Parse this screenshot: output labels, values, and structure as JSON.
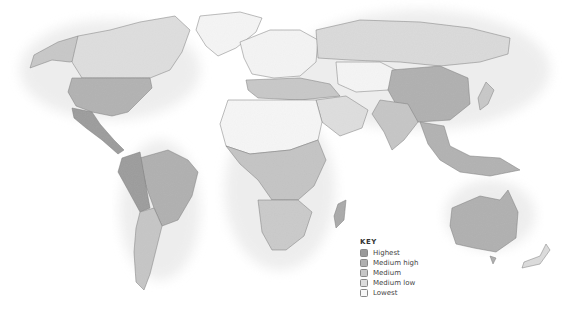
{
  "map": {
    "type": "choropleth world map",
    "style": "grayscale relief"
  },
  "legend": {
    "title": "KEY",
    "items": [
      {
        "label": "Highest",
        "color": "#9a9a9a"
      },
      {
        "label": "Medium high",
        "color": "#b0b0b0"
      },
      {
        "label": "Medium",
        "color": "#c6c6c6"
      },
      {
        "label": "Medium low",
        "color": "#dcdcdc"
      },
      {
        "label": "Lowest",
        "color": "#f7f7f7"
      }
    ]
  },
  "regions": [
    {
      "name": "Canada",
      "level": "Medium low"
    },
    {
      "name": "Alaska",
      "level": "Medium"
    },
    {
      "name": "United States",
      "level": "Medium high"
    },
    {
      "name": "Mexico & Central America",
      "level": "Highest"
    },
    {
      "name": "Greenland",
      "level": "Lowest"
    },
    {
      "name": "Brazil",
      "level": "Medium high"
    },
    {
      "name": "Andean South America",
      "level": "Highest"
    },
    {
      "name": "Southern Cone",
      "level": "Medium"
    },
    {
      "name": "Europe",
      "level": "Lowest"
    },
    {
      "name": "Mediterranean",
      "level": "Medium"
    },
    {
      "name": "Russia",
      "level": "Medium low"
    },
    {
      "name": "Central Asia",
      "level": "Lowest"
    },
    {
      "name": "China",
      "level": "Medium high"
    },
    {
      "name": "India",
      "level": "Medium"
    },
    {
      "name": "Southeast Asia",
      "level": "Medium high"
    },
    {
      "name": "North Africa",
      "level": "Lowest"
    },
    {
      "name": "Central Africa",
      "level": "Medium"
    },
    {
      "name": "Southern Africa",
      "level": "Medium"
    },
    {
      "name": "Madagascar",
      "level": "Medium high"
    },
    {
      "name": "Australia",
      "level": "Medium high"
    },
    {
      "name": "New Zealand",
      "level": "Medium low"
    }
  ]
}
